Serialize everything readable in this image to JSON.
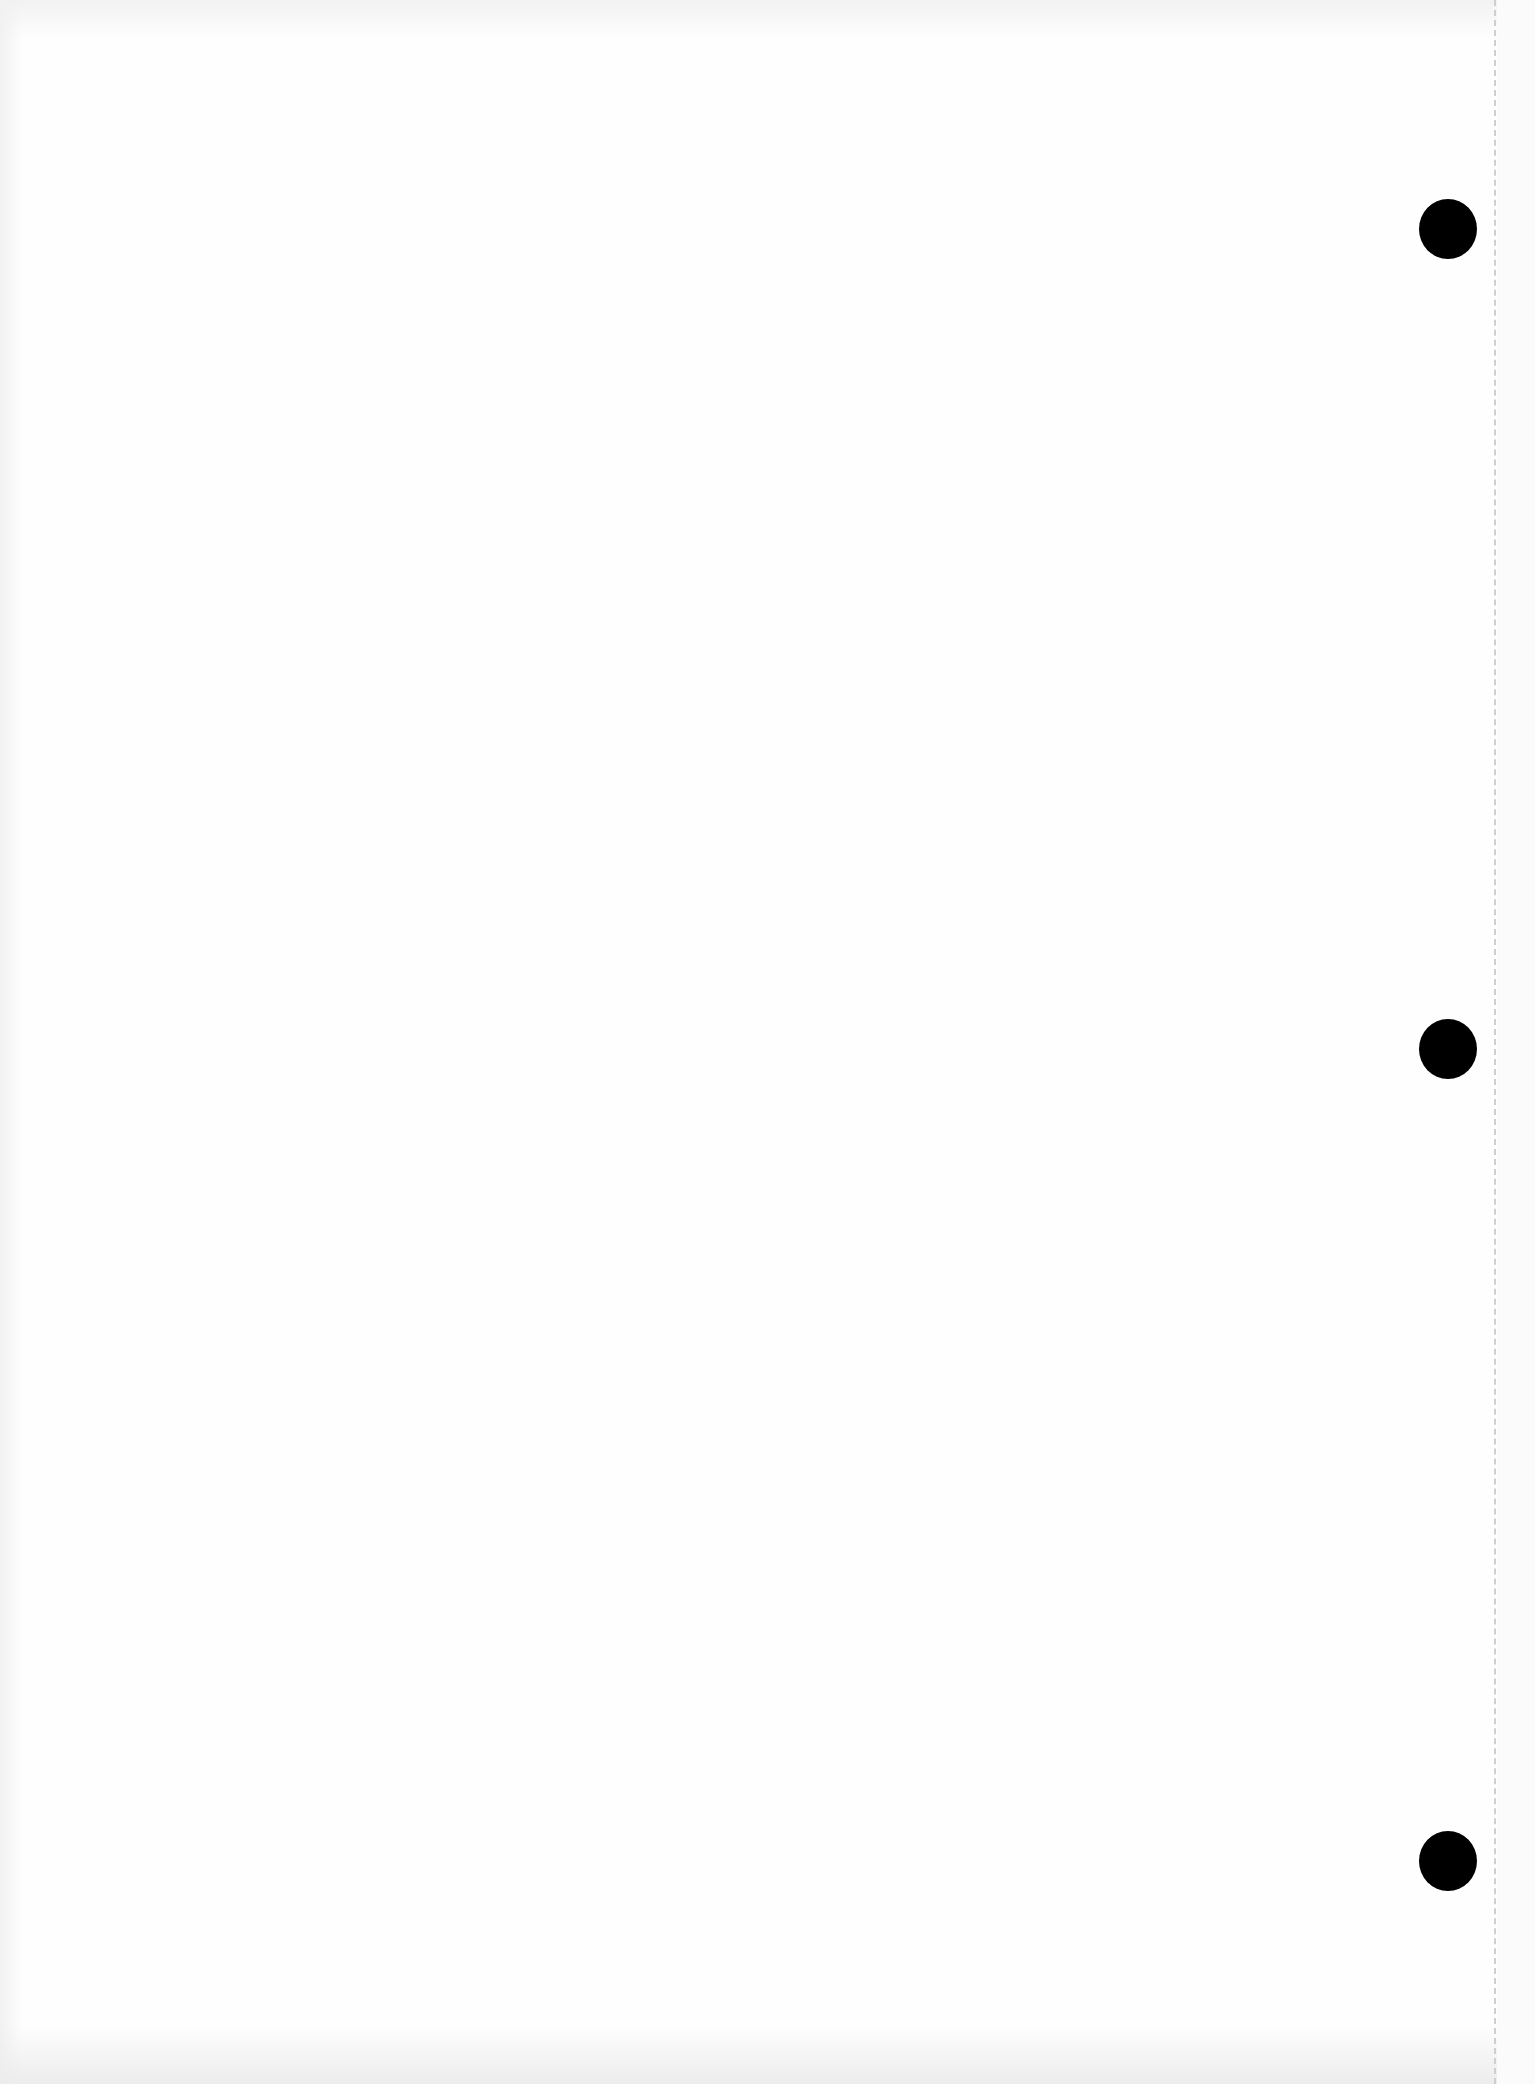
{
  "page": {
    "type": "blank scanned sheet",
    "background_color": "#fefefe",
    "text_content": ""
  },
  "punch_holes": [
    {
      "cx": 1448,
      "cy": 228,
      "diameter": 58,
      "color": "#000000"
    },
    {
      "cx": 1448,
      "cy": 1048,
      "diameter": 58,
      "color": "#000000"
    },
    {
      "cx": 1448,
      "cy": 1860,
      "diameter": 58,
      "color": "#000000"
    }
  ],
  "perforation": {
    "x": 1495,
    "style": "dashed",
    "color": "#cfcfcf"
  }
}
